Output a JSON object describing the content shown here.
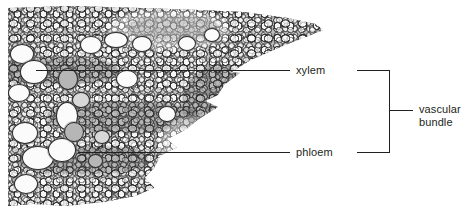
{
  "figure": {
    "type": "labelled-micrograph",
    "background_color": "#ffffff",
    "line_color": "#231f20",
    "text_color": "#231f20"
  },
  "micrograph": {
    "alt_name": "stem-cross-section-micrograph",
    "tone": "grayscale"
  },
  "labels": {
    "xylem": "xylem",
    "phloem": "phloem",
    "vascular_bundle_line1": "vascular",
    "vascular_bundle_line2": "bundle"
  },
  "annotations": [
    {
      "id": "xylem",
      "text": "xylem",
      "leader_y": 70,
      "leader_from_x": 36,
      "leader_to_x": 290
    },
    {
      "id": "phloem",
      "text": "phloem",
      "leader_y": 152,
      "leader_from_x": 78,
      "leader_to_x": 290
    }
  ],
  "bracket": {
    "x": 389,
    "top_y": 69,
    "bottom_y": 152,
    "tick_y": 110,
    "label_line1": "vascular",
    "label_line2": "bundle"
  }
}
